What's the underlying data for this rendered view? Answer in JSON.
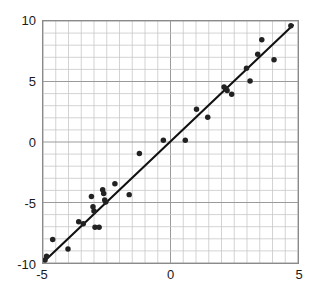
{
  "chart_data": {
    "type": "scatter",
    "title": "",
    "xlabel": "",
    "ylabel": "",
    "xlim": [
      -5,
      5
    ],
    "ylim": [
      -10,
      10
    ],
    "grid": true,
    "legend": null,
    "x_ticks": [
      -5,
      0,
      5
    ],
    "x_tick_labels": [
      "-5",
      "0",
      "5"
    ],
    "y_ticks": [
      10,
      5,
      0,
      -5,
      -10
    ],
    "y_tick_labels": [
      "10",
      "5",
      "0",
      "-5",
      "-10"
    ],
    "x_minor_gridline_step": 0.5,
    "y_minor_gridline_step": 1,
    "marker_color": "#222222",
    "marker_size": 4,
    "line_color": "#111111",
    "gridline_color": "#c8c8c8",
    "axis_color": "#8a8a8a",
    "points": [
      {
        "x": -4.92,
        "y": -9.75
      },
      {
        "x": -4.86,
        "y": -9.45
      },
      {
        "x": -4.62,
        "y": -8.05
      },
      {
        "x": -4.02,
        "y": -8.85
      },
      {
        "x": -3.6,
        "y": -6.6
      },
      {
        "x": -3.42,
        "y": -6.75
      },
      {
        "x": -3.1,
        "y": -4.5
      },
      {
        "x": -3.04,
        "y": -5.35
      },
      {
        "x": -3.0,
        "y": -5.7
      },
      {
        "x": -2.96,
        "y": -7.05
      },
      {
        "x": -2.8,
        "y": -7.05
      },
      {
        "x": -2.66,
        "y": -3.95
      },
      {
        "x": -2.62,
        "y": -4.25
      },
      {
        "x": -2.58,
        "y": -4.8
      },
      {
        "x": -2.54,
        "y": -4.95
      },
      {
        "x": -2.18,
        "y": -3.45
      },
      {
        "x": -1.62,
        "y": -4.35
      },
      {
        "x": -1.22,
        "y": -0.95
      },
      {
        "x": -0.28,
        "y": 0.15
      },
      {
        "x": 0.58,
        "y": 0.15
      },
      {
        "x": 1.02,
        "y": 2.7
      },
      {
        "x": 1.46,
        "y": 2.05
      },
      {
        "x": 2.1,
        "y": 4.55
      },
      {
        "x": 2.16,
        "y": 4.4
      },
      {
        "x": 2.22,
        "y": 4.25
      },
      {
        "x": 2.4,
        "y": 3.95
      },
      {
        "x": 2.98,
        "y": 6.1
      },
      {
        "x": 3.12,
        "y": 5.05
      },
      {
        "x": 3.42,
        "y": 7.25
      },
      {
        "x": 3.58,
        "y": 8.45
      },
      {
        "x": 4.06,
        "y": 6.8
      },
      {
        "x": 4.72,
        "y": 9.6
      }
    ],
    "fit_line": {
      "x1": -4.95,
      "y1": -9.85,
      "x2": 4.8,
      "y2": 9.65
    }
  }
}
